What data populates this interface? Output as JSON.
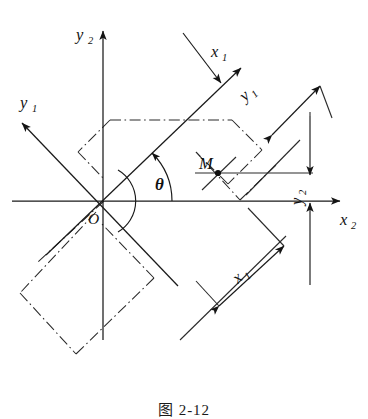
{
  "figure": {
    "caption": "图 2-12"
  },
  "colors": {
    "ink": "#1a1a1a",
    "line": "#2a2a2a",
    "background": "#ffffff"
  },
  "axes": [
    {
      "id": "y2",
      "base": "y",
      "subscript": "2",
      "label": "y",
      "direction": "up",
      "tip": [
        103,
        25
      ],
      "label_pos": [
        78,
        35
      ]
    },
    {
      "id": "x2",
      "base": "x",
      "subscript": "2",
      "label": "x",
      "direction": "right",
      "tip": [
        345,
        202
      ],
      "label_pos": [
        344,
        222
      ]
    },
    {
      "id": "x1",
      "base": "x",
      "subscript": "1",
      "label": "x",
      "direction": "up-right",
      "tip": [
        246,
        62
      ],
      "label_pos": [
        213,
        53
      ]
    },
    {
      "id": "y1",
      "base": "y",
      "subscript": "1",
      "label": "y",
      "direction": "up-left",
      "tip": [
        16,
        117
      ],
      "label_pos": [
        22,
        104
      ]
    }
  ],
  "origin": {
    "label": "O",
    "x": 104,
    "y": 201,
    "label_pos": [
      89,
      222
    ]
  },
  "point": {
    "label": "M",
    "x": 218,
    "y": 173,
    "label_pos": [
      200,
      166
    ]
  },
  "angle": {
    "symbol": "θ",
    "label_pos": [
      160,
      187
    ],
    "value_deg": 42,
    "vertex": [
      104,
      201
    ]
  },
  "dimensions": [
    {
      "id": "x1-dimension",
      "label": "x",
      "subscript": "1",
      "label_pos": [
        243,
        280
      ],
      "rotation_deg": -42,
      "from": [
        218,
        307
      ],
      "to": [
        285,
        246
      ]
    },
    {
      "id": "y1-dimension",
      "label": "y",
      "subscript": "1",
      "label_pos": [
        253,
        98
      ],
      "rotation_deg": -42,
      "from": [
        270,
        133
      ],
      "to": [
        318,
        87
      ]
    },
    {
      "id": "y2-dimension",
      "label": "y",
      "subscript": "2",
      "label_pos": [
        300,
        200
      ],
      "rotation_deg": -90,
      "from": [
        310,
        117
      ],
      "to": [
        310,
        173
      ]
    },
    {
      "id": "x1-axis-leader",
      "label": "",
      "subscript": "",
      "label_pos": [
        0,
        0
      ],
      "rotation_deg": 0,
      "from": [
        185,
        35
      ],
      "to": [
        222,
        84
      ]
    }
  ]
}
